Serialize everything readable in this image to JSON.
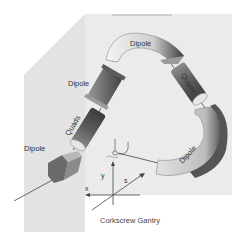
{
  "diagram": {
    "title": "Corkscrew Gantry",
    "components": [
      {
        "id": "dipole-top",
        "label": "Dipole"
      },
      {
        "id": "quads-right",
        "label": "Quads"
      },
      {
        "id": "dipole-right",
        "label": "Dipole"
      },
      {
        "id": "dipole-upper-left",
        "label": "Dipole"
      },
      {
        "id": "quads-left",
        "label": "Quads"
      },
      {
        "id": "dipole-lower-left",
        "label": "Dipole"
      }
    ],
    "axes": {
      "x": "x",
      "y": "y",
      "s": "s"
    },
    "colors": {
      "background_panel": "#ececec",
      "magnet_dark": "#5a5a5a",
      "magnet_light": "#e8e8e8",
      "text": "#333333"
    }
  }
}
